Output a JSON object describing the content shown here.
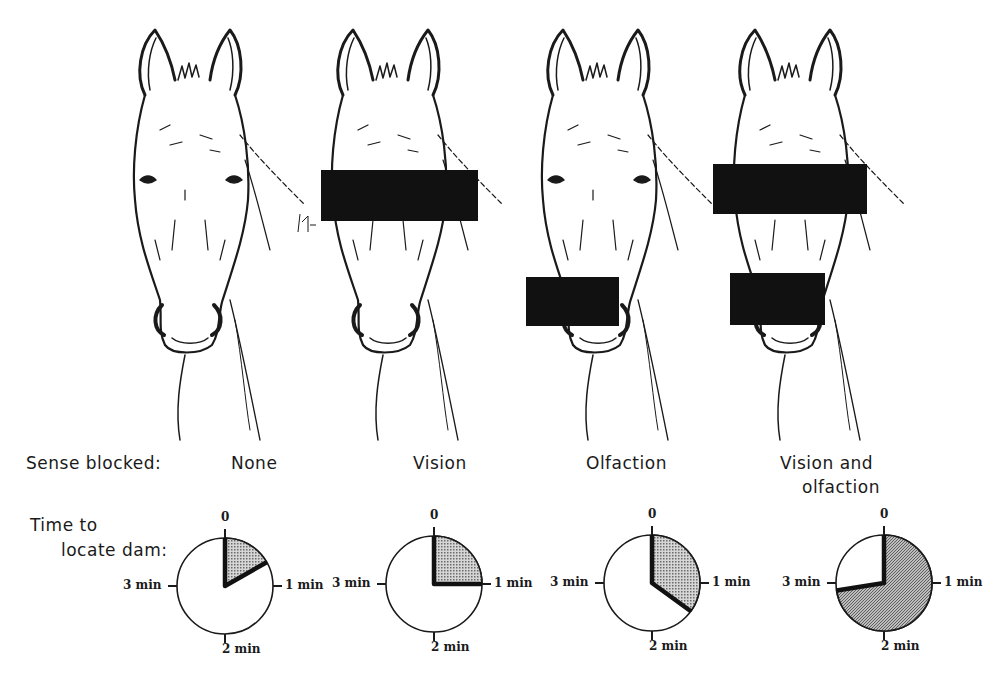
{
  "figure": {
    "row_label_sense": "Sense blocked:",
    "row_label_time_line1": "Time to",
    "row_label_time_line2": "locate dam:",
    "ink_color": "#1a1a1a",
    "shade_color": "#9a9a9a",
    "background": "#ffffff"
  },
  "panels": [
    {
      "id": "none",
      "sense_blocked": "None",
      "sense_blocked_line2": "",
      "blocks": [],
      "time_min": 0.67
    },
    {
      "id": "vision",
      "sense_blocked": "Vision",
      "sense_blocked_line2": "",
      "blocks": [
        "eyes"
      ],
      "time_min": 1.0
    },
    {
      "id": "olfaction",
      "sense_blocked": "Olfaction",
      "sense_blocked_line2": "",
      "blocks": [
        "nose"
      ],
      "time_min": 1.4
    },
    {
      "id": "vision-olfaction",
      "sense_blocked": "Vision and",
      "sense_blocked_line2": "olfaction",
      "blocks": [
        "eyes",
        "nose"
      ],
      "time_min": 2.9
    }
  ],
  "dial_ticks": {
    "top": "0",
    "right": "1 min",
    "bottom": "2 min",
    "left": "3 min"
  },
  "chart_data": {
    "type": "pie",
    "categories": [
      "None",
      "Vision",
      "Olfaction",
      "Vision and olfaction"
    ],
    "values": [
      0.67,
      1.0,
      1.4,
      2.9
    ],
    "unit": "min",
    "dial_range": [
      0,
      4
    ],
    "dial_ticks": [
      "0",
      "1 min",
      "2 min",
      "3 min"
    ],
    "legend": "none"
  }
}
